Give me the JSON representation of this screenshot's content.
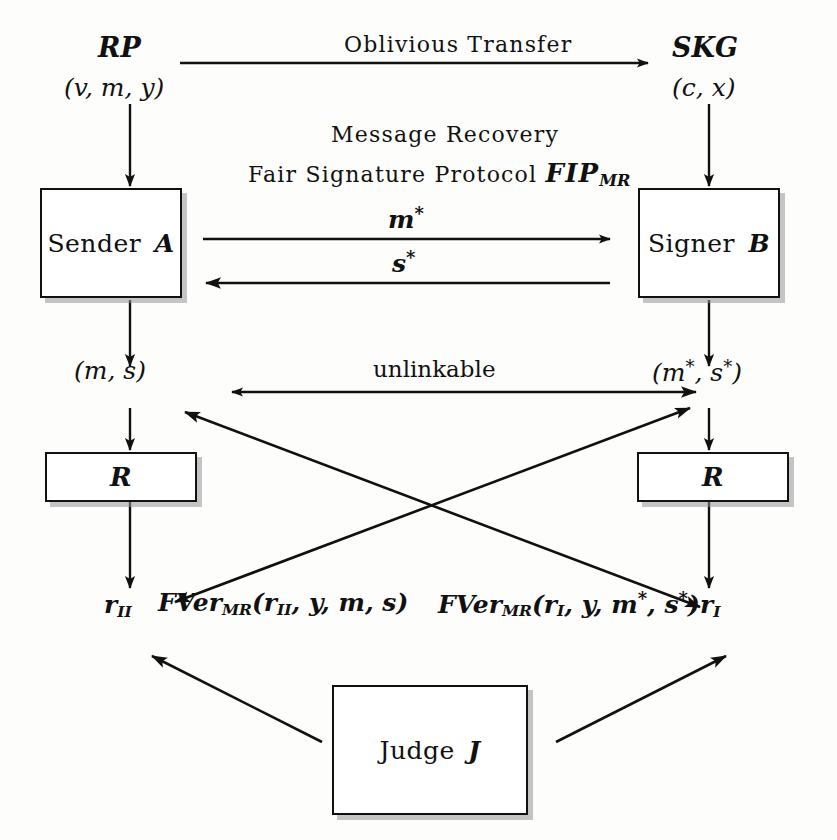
{
  "diagram": {
    "ink_color": "#111111",
    "background_color": "#fdfdfc",
    "shadow_color": "#969696"
  },
  "top_parties": {
    "left_name": "RP",
    "left_params": "(v, m, y)",
    "right_name": "SKG",
    "right_params": "(c, x)"
  },
  "channel_labels": {
    "oblivious_transfer": "Oblivious Transfer",
    "protocol_line1": "Message Recovery",
    "protocol_line2_prefix": "Fair Signature Protocol ",
    "protocol_line2_name": "FIP",
    "protocol_line2_sub": "MR",
    "msg_forward": "m",
    "msg_forward_star": "*",
    "msg_back": "s",
    "msg_back_star": "*",
    "unlinkable": "unlinkable"
  },
  "boxes": {
    "sender": {
      "text": "Sender ",
      "italic": "A"
    },
    "signer": {
      "text": "Signer ",
      "italic": "B"
    },
    "receiver_left": {
      "italic": "R"
    },
    "receiver_right": {
      "italic": "R"
    },
    "judge": {
      "text": "Judge ",
      "italic": "J"
    }
  },
  "outputs": {
    "left_pair": "(m, s)",
    "right_pair_base": "(m",
    "right_pair_mid": ", s",
    "right_pair_end": ")",
    "right_pair_star": "*",
    "left_result": "r",
    "left_result_sub": "II",
    "right_result": "r",
    "right_result_sub": "I"
  },
  "verification": {
    "left_fn_name": "FVer",
    "left_fn_sub": "MR",
    "left_fn_args_open": "(r",
    "left_fn_args_sub": "II",
    "left_fn_args_rest": ", y, m, s)",
    "right_fn_name": "FVer",
    "right_fn_sub": "MR",
    "right_fn_args_open": "(r",
    "right_fn_args_sub": "I",
    "right_fn_args_mid": ", y, m",
    "right_fn_args_star1": "*",
    "right_fn_args_mid2": ", s",
    "right_fn_args_star2": "*",
    "right_fn_args_close": ")"
  },
  "arrows": [
    {
      "name": "oblivious-transfer-arrow",
      "from": [
        180,
        62
      ],
      "to": [
        650,
        62
      ],
      "direction": "right"
    },
    {
      "name": "rp-to-sender-arrow",
      "from": [
        130,
        102
      ],
      "to": [
        130,
        188
      ],
      "direction": "down"
    },
    {
      "name": "skg-to-signer-arrow",
      "from": [
        708,
        102
      ],
      "to": [
        708,
        188
      ],
      "direction": "down"
    },
    {
      "name": "m-star-arrow",
      "from": [
        205,
        238
      ],
      "to": [
        612,
        238
      ],
      "direction": "right"
    },
    {
      "name": "s-star-arrow",
      "from": [
        612,
        282
      ],
      "to": [
        205,
        282
      ],
      "direction": "left"
    },
    {
      "name": "sender-to-ms-arrow",
      "from": [
        130,
        296
      ],
      "to": [
        130,
        368
      ],
      "direction": "down"
    },
    {
      "name": "signer-to-mstar-arrow",
      "from": [
        708,
        296
      ],
      "to": [
        708,
        368
      ],
      "direction": "down"
    },
    {
      "name": "unlinkable-arrow",
      "from": [
        228,
        392
      ],
      "to": [
        700,
        392
      ],
      "direction": "both"
    },
    {
      "name": "ms-to-r-arrow",
      "from": [
        130,
        404
      ],
      "to": [
        130,
        452
      ],
      "direction": "down"
    },
    {
      "name": "mstar-to-r-arrow",
      "from": [
        708,
        404
      ],
      "to": [
        708,
        452
      ],
      "direction": "down"
    },
    {
      "name": "r-to-result-arrow-left",
      "from": [
        130,
        500
      ],
      "to": [
        130,
        590
      ],
      "direction": "down"
    },
    {
      "name": "r-to-result-arrow-right",
      "from": [
        708,
        500
      ],
      "to": [
        708,
        590
      ],
      "direction": "down"
    },
    {
      "name": "cross-arrow-to-left-pair",
      "from": [
        700,
        608
      ],
      "to": [
        190,
        414
      ],
      "direction": "up-left"
    },
    {
      "name": "cross-arrow-to-right-pair",
      "from": [
        178,
        604
      ],
      "to": [
        688,
        410
      ],
      "direction": "up-right"
    },
    {
      "name": "judge-to-left-arrow",
      "from": [
        320,
        740
      ],
      "to": [
        150,
        654
      ],
      "direction": "up-left"
    },
    {
      "name": "judge-to-right-arrow",
      "from": [
        560,
        740
      ],
      "to": [
        730,
        654
      ],
      "direction": "up-right"
    }
  ]
}
